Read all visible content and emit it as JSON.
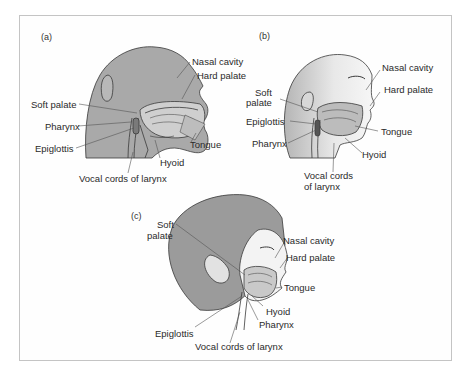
{
  "figure": {
    "panels": [
      {
        "id": "a",
        "tag": "(a)",
        "labels": {
          "nasal_cavity": "Nasal cavity",
          "hard_palate": "Hard palate",
          "soft_palate": "Soft palate",
          "pharynx": "Pharynx",
          "epiglottis": "Epiglottis",
          "tongue": "Tongue",
          "hyoid": "Hyoid",
          "vocal_cords": "Vocal cords of larynx"
        }
      },
      {
        "id": "b",
        "tag": "(b)",
        "labels": {
          "nasal_cavity": "Nasal cavity",
          "hard_palate": "Hard palate",
          "soft_palate_1": "Soft",
          "soft_palate_2": "palate",
          "epiglottis": "Epiglottis",
          "pharynx": "Pharynx",
          "tongue": "Tongue",
          "hyoid": "Hyoid",
          "vocal_cords_1": "Vocal cords",
          "vocal_cords_2": "of larynx"
        }
      },
      {
        "id": "c",
        "tag": "(c)",
        "labels": {
          "soft_palate_1": "Soft",
          "soft_palate_2": "palate",
          "nasal_cavity": "Nasal cavity",
          "hard_palate": "Hard palate",
          "tongue": "Tongue",
          "hyoid": "Hyoid",
          "pharynx": "Pharynx",
          "epiglottis": "Epiglottis",
          "vocal_cords": "Vocal cords of larynx"
        }
      }
    ],
    "colors": {
      "head_fill": "#a9a9a9",
      "hair_fill": "#9a9a9a",
      "skin_light": "#f2f2f2",
      "line": "#3a3a3a",
      "frame": "#c4c4c4"
    }
  }
}
